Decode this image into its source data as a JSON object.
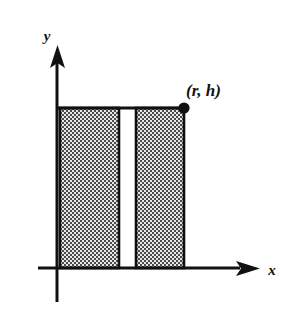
{
  "figure": {
    "title": "",
    "background_color": "#ffffff",
    "stroke_color": "#111111",
    "fill_pattern_color": "#555555",
    "fill_pattern_background": "#e8e8e8"
  },
  "axes": {
    "x_label": "x",
    "y_label": "y",
    "x_axis": {
      "x_start": 38,
      "x_end": 258,
      "y": 268,
      "arrow": "right"
    },
    "y_axis": {
      "x": 57,
      "y_start": 302,
      "y_end": 48,
      "arrow": "up"
    }
  },
  "point": {
    "label": "(r, h)",
    "x": 184,
    "y": 108,
    "marker": "filled-circle",
    "radius": 5
  },
  "shapes": [
    {
      "name": "left-shaded-rectangle",
      "x": 60,
      "y": 108,
      "width": 59,
      "height": 160,
      "fill": "checker-pattern"
    },
    {
      "name": "right-shaded-rectangle",
      "x": 136,
      "y": 108,
      "width": 48,
      "height": 160,
      "fill": "checker-pattern"
    }
  ],
  "gap": {
    "name": "white-gap",
    "x": 119,
    "width": 17
  },
  "top_edge": {
    "name": "rectangle-top-edge",
    "x_start": 57,
    "x_end": 184,
    "y": 108
  }
}
